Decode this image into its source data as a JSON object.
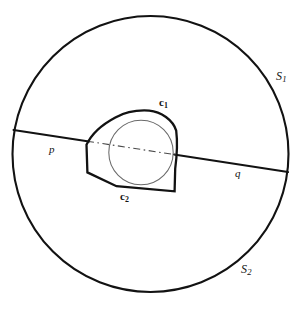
{
  "figure": {
    "labels": {
      "outer_circle_top": "S",
      "outer_circle_top_sub": "1",
      "outer_circle_bottom": "S",
      "outer_circle_bottom_sub": "2",
      "upper_arc": "c",
      "upper_arc_sub": "1",
      "lower_arc": "c",
      "lower_arc_sub": "2",
      "chord_left_endpoint": "p",
      "chord_right_endpoint": "q"
    },
    "colors": {
      "stroke": "#121212",
      "thin_stroke": "#555555",
      "background": "#ffffff"
    },
    "geometry": {
      "outer_circle": {
        "cx": 150.5,
        "cy": 154,
        "r": 138
      },
      "inner_thin_circle": {
        "cx": 141,
        "cy": 152.5,
        "r": 32.5
      },
      "chord": {
        "x1": 13.5,
        "y1": 130,
        "x2": 288,
        "y2": 172
      },
      "chord_dashed_span": {
        "x1": 88,
        "y1": 152,
        "x2": 176,
        "y2": 165
      },
      "convex_shape_vertices": [
        {
          "x": 86,
          "y": 145
        },
        {
          "x": 87,
          "y": 172
        },
        {
          "x": 116,
          "y": 186
        },
        {
          "x": 174,
          "y": 191
        },
        {
          "x": 175,
          "y": 169
        },
        {
          "x": 177,
          "y": 125
        },
        {
          "x": 152,
          "y": 111
        },
        {
          "x": 119,
          "y": 114
        }
      ]
    }
  }
}
